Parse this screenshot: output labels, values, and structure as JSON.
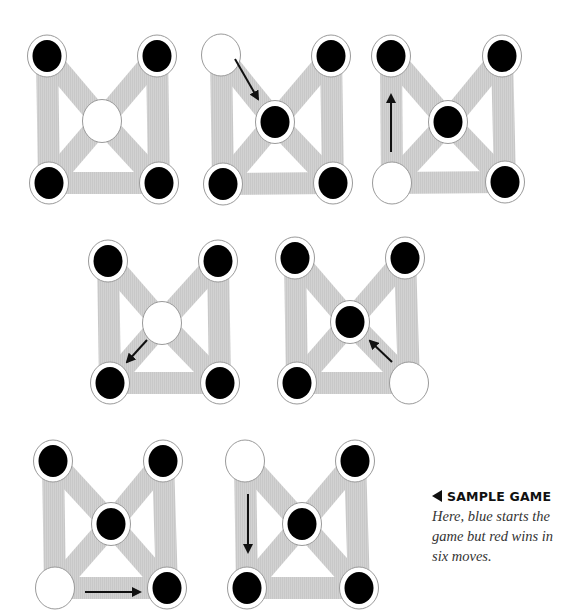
{
  "caption": {
    "title": "SAMPLE GAME",
    "icon": "left-triangle-icon",
    "body": "Here, blue starts the game but red wins in six moves."
  },
  "colors": {
    "edge": "#cfcfcf",
    "piece": "#000000",
    "node_ring": "#ffffff",
    "node_outline": "#9a9a9a",
    "arrow": "#111111"
  },
  "boards": [
    {
      "step": 1,
      "nodes": {
        "TL": [
          47,
          56
        ],
        "TR": [
          157,
          56
        ],
        "C": [
          102,
          121
        ],
        "BL": [
          49,
          183
        ],
        "BR": [
          159,
          183
        ]
      },
      "state": {
        "TL": "black",
        "TR": "black",
        "C": "empty",
        "BL": "black",
        "BR": "black"
      },
      "arrow": null
    },
    {
      "step": 2,
      "nodes": {
        "TL": [
          221,
          55
        ],
        "TR": [
          331,
          56
        ],
        "C": [
          275,
          122
        ],
        "BL": [
          223,
          184
        ],
        "BR": [
          333,
          183
        ]
      },
      "state": {
        "TL": "empty",
        "TR": "black",
        "C": "black",
        "BL": "black",
        "BR": "black"
      },
      "arrow": {
        "from": [
          235,
          59
        ],
        "to": [
          258,
          99
        ]
      }
    },
    {
      "step": 3,
      "nodes": {
        "TL": [
          391,
          56
        ],
        "TR": [
          502,
          56
        ],
        "C": [
          448,
          122
        ],
        "BL": [
          392,
          183
        ],
        "BR": [
          505,
          182
        ]
      },
      "state": {
        "TL": "black",
        "TR": "black",
        "C": "black",
        "BL": "empty",
        "BR": "black"
      },
      "arrow": {
        "from": [
          391,
          152
        ],
        "to": [
          391,
          95
        ]
      }
    },
    {
      "step": 4,
      "nodes": {
        "TL": [
          108,
          261
        ],
        "TR": [
          218,
          261
        ],
        "C": [
          162,
          323
        ],
        "BL": [
          110,
          383
        ],
        "BR": [
          220,
          383
        ]
      },
      "state": {
        "TL": "black",
        "TR": "black",
        "C": "empty",
        "BL": "black",
        "BR": "black"
      },
      "arrow": {
        "from": [
          147,
          340
        ],
        "to": [
          127,
          362
        ]
      }
    },
    {
      "step": 5,
      "nodes": {
        "TL": [
          295,
          258
        ],
        "TR": [
          405,
          258
        ],
        "C": [
          350,
          322
        ],
        "BL": [
          297,
          383
        ],
        "BR": [
          409,
          383
        ]
      },
      "state": {
        "TL": "black",
        "TR": "black",
        "C": "black",
        "BL": "black",
        "BR": "empty"
      },
      "arrow": {
        "from": [
          392,
          362
        ],
        "to": [
          370,
          341
        ]
      }
    },
    {
      "step": 6,
      "nodes": {
        "TL": [
          53,
          461
        ],
        "TR": [
          163,
          461
        ],
        "C": [
          111,
          524
        ],
        "BL": [
          55,
          588
        ],
        "BR": [
          167,
          588
        ]
      },
      "state": {
        "TL": "black",
        "TR": "black",
        "C": "black",
        "BL": "empty",
        "BR": "black"
      },
      "arrow": {
        "from": [
          85,
          592
        ],
        "to": [
          140,
          592
        ]
      }
    },
    {
      "step": 7,
      "nodes": {
        "TL": [
          245,
          461
        ],
        "TR": [
          355,
          461
        ],
        "C": [
          302,
          524
        ],
        "BL": [
          247,
          588
        ],
        "BR": [
          359,
          588
        ]
      },
      "state": {
        "TL": "empty",
        "TR": "black",
        "C": "black",
        "BL": "black",
        "BR": "black"
      },
      "arrow": {
        "from": [
          248,
          494
        ],
        "to": [
          248,
          552
        ]
      }
    }
  ]
}
